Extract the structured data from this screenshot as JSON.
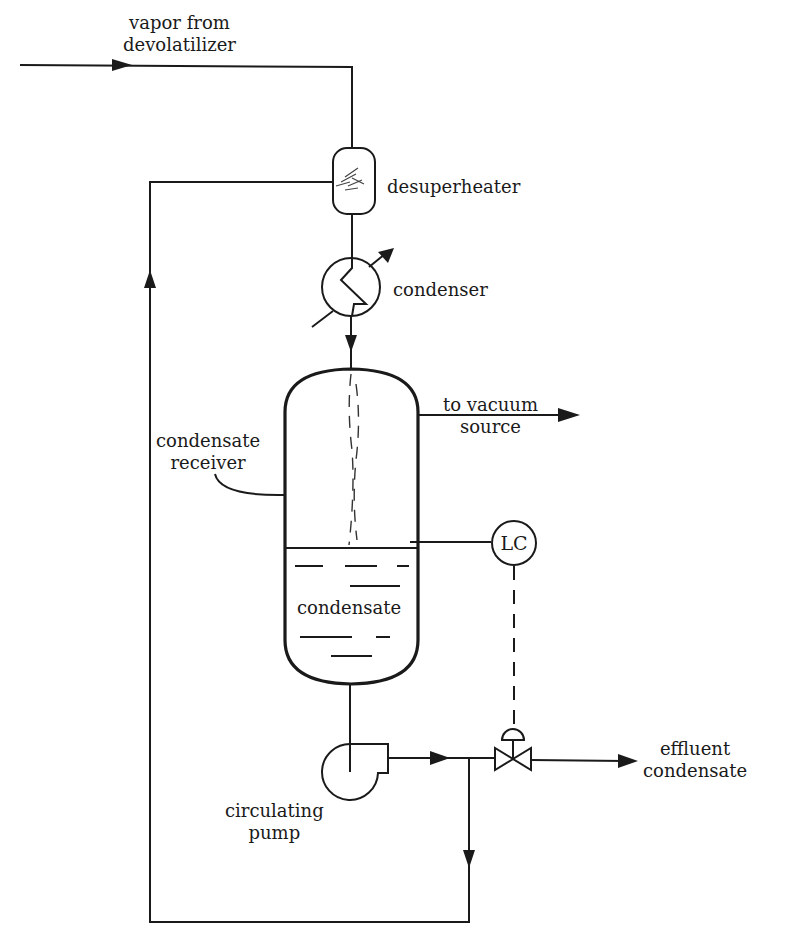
{
  "diagram": {
    "type": "process-flow-diagram",
    "labels": {
      "vapor_in": [
        "vapor from",
        "devolatilizer"
      ],
      "desuperheater": "desuperheater",
      "condenser": "condenser",
      "receiver": [
        "condensate",
        "receiver"
      ],
      "vacuum": [
        "to vacuum",
        "source"
      ],
      "condensate": "condensate",
      "level_controller": "LC",
      "pump": [
        "circulating",
        "pump"
      ],
      "effluent": [
        "effluent",
        "condensate"
      ]
    },
    "components": [
      {
        "id": "desuperheater",
        "label": "desuperheater",
        "shape": "rounded-vessel"
      },
      {
        "id": "condenser",
        "label": "condenser",
        "shape": "heat-exchanger-circle"
      },
      {
        "id": "condensate-receiver",
        "label": "condensate receiver",
        "shape": "vertical-vessel"
      },
      {
        "id": "level-controller",
        "label": "LC",
        "shape": "instrument-circle"
      },
      {
        "id": "control-valve",
        "label": "",
        "shape": "diaphragm-valve"
      },
      {
        "id": "circulating-pump",
        "label": "circulating pump",
        "shape": "centrifugal-pump"
      }
    ],
    "connections": [
      {
        "from": "vapor from devolatilizer",
        "to": "desuperheater",
        "type": "process"
      },
      {
        "from": "desuperheater",
        "to": "condenser",
        "type": "process"
      },
      {
        "from": "condenser",
        "to": "condensate-receiver",
        "type": "process"
      },
      {
        "from": "condensate-receiver",
        "to": "to vacuum source",
        "type": "process"
      },
      {
        "from": "condensate-receiver",
        "to": "circulating-pump",
        "type": "process"
      },
      {
        "from": "circulating-pump",
        "to": "control-valve",
        "type": "process"
      },
      {
        "from": "control-valve",
        "to": "effluent condensate",
        "type": "process"
      },
      {
        "from": "circulating-pump",
        "to": "desuperheater",
        "type": "recycle"
      },
      {
        "from": "condensate-receiver",
        "to": "level-controller",
        "type": "measurement"
      },
      {
        "from": "level-controller",
        "to": "control-valve",
        "type": "signal"
      }
    ]
  }
}
